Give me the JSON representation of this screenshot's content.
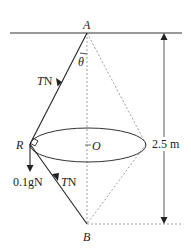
{
  "diagram": {
    "points": {
      "A": {
        "label": "A",
        "x": 87,
        "y": 33
      },
      "R": {
        "label": "R",
        "x": 30,
        "y": 144
      },
      "B": {
        "label": "B",
        "x": 87,
        "y": 224
      },
      "O": {
        "label": "O",
        "x": 88,
        "y": 145
      }
    },
    "angle_label": "θ",
    "forces": {
      "upper_string": {
        "label_var": "T",
        "label_unit": "N"
      },
      "lower_string": {
        "label_var": "T",
        "label_unit": "N"
      },
      "weight": {
        "label": "0.1gN"
      }
    },
    "dimension": {
      "label": "2.5 m"
    },
    "colors": {
      "line": "#222222",
      "dashed": "#888888"
    }
  }
}
